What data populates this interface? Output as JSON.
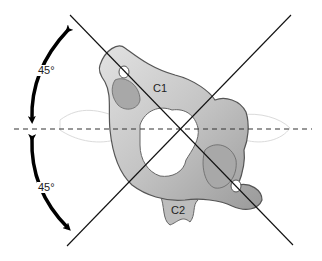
{
  "figure": {
    "labels": {
      "c1": "C1",
      "c2": "C2",
      "angle_upper": "45°",
      "angle_lower": "45°"
    },
    "colors": {
      "bone_fill": "#c8c8c8",
      "bone_shadow": "#8f8f8f",
      "bone_outline": "#555555",
      "line": "#111111",
      "arrow": "#000000"
    }
  }
}
